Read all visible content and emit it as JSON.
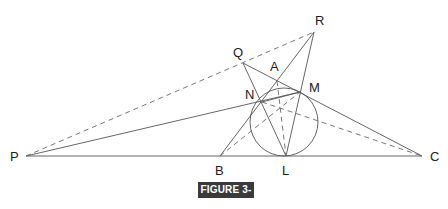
{
  "figure": {
    "caption": "FIGURE 3-11",
    "caption_bg": "#3a3a3a"
  },
  "points": {
    "P": {
      "label": "P",
      "x": 26,
      "y": 156
    },
    "Q": {
      "label": "Q",
      "x": 243,
      "y": 63
    },
    "R": {
      "label": "R",
      "x": 314,
      "y": 32
    },
    "A": {
      "label": "A",
      "x": 277,
      "y": 81
    },
    "N": {
      "label": "N",
      "x": 262,
      "y": 102
    },
    "M": {
      "label": "M",
      "x": 300,
      "y": 92
    },
    "B": {
      "label": "B",
      "x": 220,
      "y": 156
    },
    "L": {
      "label": "L",
      "x": 286,
      "y": 156
    },
    "C": {
      "label": "C",
      "x": 422,
      "y": 156
    }
  },
  "circle": {
    "cx": 284,
    "cy": 122,
    "r": 34
  },
  "line_color": "#555555"
}
